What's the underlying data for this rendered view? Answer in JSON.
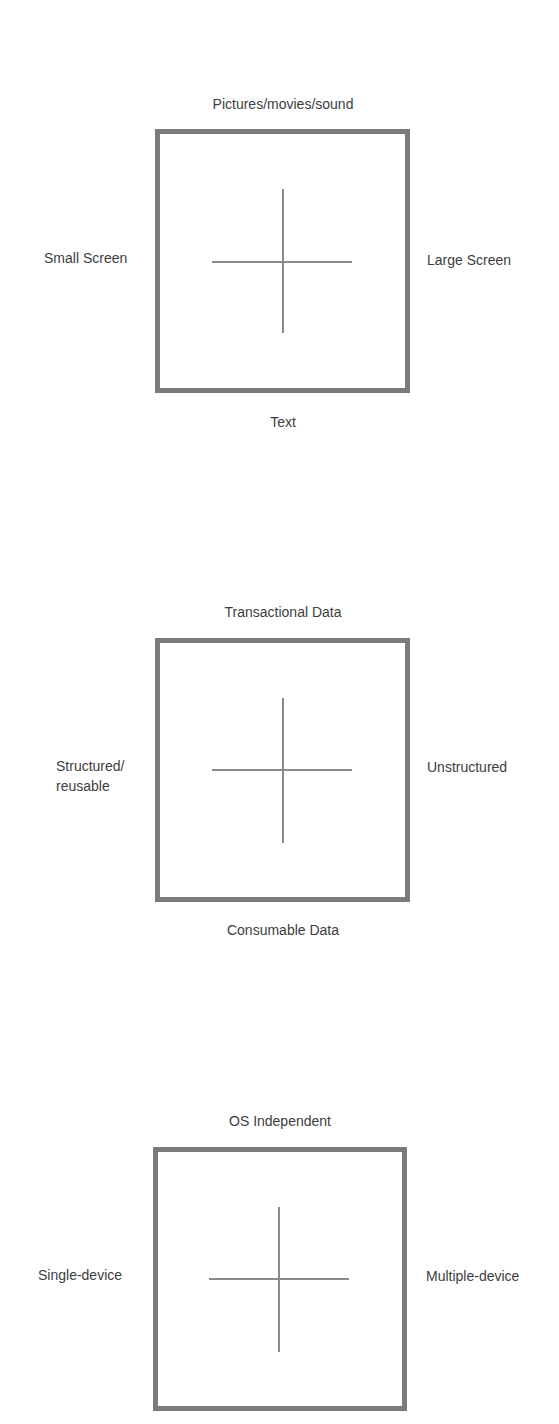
{
  "diagrams": [
    {
      "top": "Pictures/movies/sound",
      "bottom": "Text",
      "left": "Small Screen",
      "right": "Large Screen"
    },
    {
      "top": "Transactional Data",
      "bottom": "Consumable Data",
      "left": "Structured/ reusable",
      "right": "Unstructured"
    },
    {
      "top": "OS Independent",
      "bottom": "",
      "left": "Single-device",
      "right": "Multiple-device"
    }
  ],
  "colors": {
    "box_border": "#7b7b7b",
    "axis_line": "#8a8a8a",
    "label_text": "#3d3d3d",
    "background": "#ffffff"
  }
}
